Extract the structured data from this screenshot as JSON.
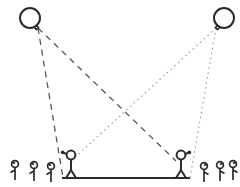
{
  "figure": {
    "type": "line-diagram",
    "width": 240,
    "height": 187,
    "background_color": "#ffffff",
    "stroke_color": "#2b2b2b",
    "dashed_color": "#555555",
    "dotted_color": "#9a9a9a"
  },
  "balloons": [
    {
      "name": "balloon-left",
      "label": "left balloon",
      "cx": 30,
      "cy": 18,
      "r": 10,
      "knot_x": 38,
      "knot_y": 27,
      "stroke_color": "#2b2b2b"
    },
    {
      "name": "balloon-right",
      "label": "right balloon",
      "cx": 224,
      "cy": 18,
      "r": 10,
      "knot_x": 216,
      "knot_y": 27,
      "stroke_color": "#2b2b2b"
    }
  ],
  "sight_lines": [
    {
      "name": "sightline-left-balloon-to-platform-left",
      "from": "balloon-left",
      "to": "platform-left-end",
      "style": "dashed",
      "x1": 38,
      "y1": 28,
      "x2": 63,
      "y2": 178,
      "color": "#555555",
      "dash_pattern": "6 5"
    },
    {
      "name": "sightline-left-balloon-to-right-observer",
      "from": "balloon-left",
      "to": "observer-right",
      "style": "dashed",
      "x1": 38,
      "y1": 28,
      "x2": 176,
      "y2": 161,
      "color": "#555555",
      "dash_pattern": "6 5"
    },
    {
      "name": "sightline-right-balloon-to-left-observer",
      "from": "balloon-right",
      "to": "observer-left",
      "style": "dotted",
      "x1": 216,
      "y1": 28,
      "x2": 72,
      "y2": 160,
      "color": "#9a9a9a",
      "dash_pattern": "1.6 3.4"
    },
    {
      "name": "sightline-right-balloon-to-platform-right",
      "from": "balloon-right",
      "to": "platform-right-end",
      "style": "dotted",
      "x1": 216,
      "y1": 28,
      "x2": 190,
      "y2": 178,
      "color": "#9a9a9a",
      "dash_pattern": "1.6 3.4"
    }
  ],
  "platform": {
    "name": "platform-baseline",
    "label": "measurement baseline",
    "x1": 62,
    "x2": 190,
    "y": 178,
    "thickness": 2.2,
    "color": "#2b2b2b"
  },
  "observers": [
    {
      "name": "observer-left",
      "label": "left observer",
      "head_cx": 71,
      "head_cy": 155,
      "head_r": 4.4,
      "body_x": 71,
      "body_top": 159.5,
      "body_bottom": 170,
      "arm_dir": "left",
      "arm_x": 63,
      "arm_y": 154,
      "leg_span": 6,
      "foot_y": 178
    },
    {
      "name": "observer-right",
      "label": "right observer",
      "head_cx": 181,
      "head_cy": 155,
      "head_r": 4.4,
      "body_x": 181,
      "body_top": 159.5,
      "body_bottom": 170,
      "arm_dir": "right",
      "arm_x": 189,
      "arm_y": 154,
      "leg_span": 6,
      "foot_y": 178
    }
  ],
  "crowd_left": [
    {
      "name": "crowd-figure-left-1",
      "head_cx": 15,
      "head_cy": 164,
      "head_r": 3.4,
      "foot_y": 180,
      "arm_dir": "left"
    },
    {
      "name": "crowd-figure-left-2",
      "head_cx": 34,
      "head_cy": 165,
      "head_r": 3.4,
      "foot_y": 181,
      "arm_dir": "left"
    },
    {
      "name": "crowd-figure-left-3",
      "head_cx": 51,
      "head_cy": 166,
      "head_r": 3.4,
      "foot_y": 182,
      "arm_dir": "left"
    }
  ],
  "crowd_right": [
    {
      "name": "crowd-figure-right-1",
      "head_cx": 204,
      "head_cy": 166,
      "head_r": 3.4,
      "foot_y": 182,
      "arm_dir": "right"
    },
    {
      "name": "crowd-figure-right-2",
      "head_cx": 220,
      "head_cy": 165,
      "head_r": 3.4,
      "foot_y": 181,
      "arm_dir": "right"
    },
    {
      "name": "crowd-figure-right-3",
      "head_cx": 233,
      "head_cy": 164,
      "head_r": 3.4,
      "foot_y": 180,
      "arm_dir": "right"
    }
  ]
}
